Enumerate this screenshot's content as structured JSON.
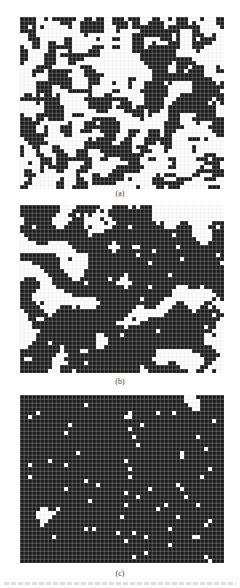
{
  "figure": {
    "panels": [
      {
        "id": "a",
        "label": "(a)",
        "top": 17,
        "cols": 51,
        "rows": 43,
        "cell": 4,
        "state": "disordered",
        "seed": 11,
        "smoothing": 1,
        "density": 0.5
      },
      {
        "id": "b",
        "label": "(b)",
        "top": 205,
        "cols": 51,
        "rows": 42,
        "cell": 4,
        "state": "domains",
        "seed": 29,
        "smoothing": 6,
        "density": 0.55
      },
      {
        "id": "c",
        "label": "(c)",
        "top": 395,
        "cols": 51,
        "rows": 42,
        "cell": 4,
        "state": "mostly-ordered",
        "seed": 47,
        "smoothing": 9,
        "density": 0.68
      }
    ],
    "colors": {
      "occupied": "#1a1a1a",
      "empty": "#ffffff",
      "gridline": "#d8d8d8"
    }
  }
}
